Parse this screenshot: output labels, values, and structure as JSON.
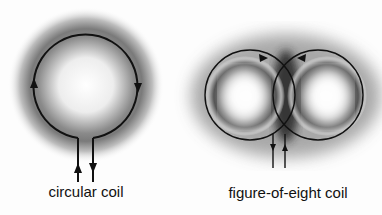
{
  "figure": {
    "panels": [
      {
        "id": "circular",
        "label": "circular coil",
        "label_x": 86,
        "label_y": 183
      },
      {
        "id": "figure-eight",
        "label": "figure-of-eight coil",
        "label_x": 288,
        "label_y": 184
      }
    ],
    "colors": {
      "stroke": "#111111",
      "field_dark": "#3a3a3a",
      "background": "#fdfdfd"
    }
  }
}
